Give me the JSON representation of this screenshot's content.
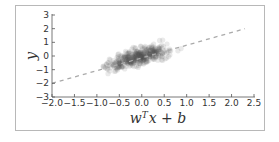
{
  "chart_data": {
    "type": "scatter",
    "title": "",
    "xlabel": "w^T x + b",
    "ylabel": "y",
    "xlim": [
      -2.0,
      2.5
    ],
    "ylim": [
      -3,
      3
    ],
    "x_ticks": [
      "-2.0",
      "-1.5",
      "-1.0",
      "-0.5",
      "0.0",
      "0.5",
      "1.0",
      "1.5",
      "2.0",
      "2.5"
    ],
    "y_ticks": [
      "3",
      "2",
      "1",
      "0",
      "-1",
      "-2",
      "-3"
    ],
    "grid": false,
    "legend": null,
    "series": [
      {
        "name": "samples",
        "kind": "scatter",
        "color": "#555555",
        "alpha": 0.12,
        "description": "dense cloud of semi-transparent points, x mostly in [-1.3, 1.1], y approx 0.9x with noise sd ~0.5"
      },
      {
        "name": "fit",
        "kind": "line",
        "style": "dashed",
        "color": "#aaaaaa",
        "x": [
          -2.0,
          2.3
        ],
        "y": [
          -2.0,
          2.0
        ]
      }
    ]
  },
  "labels": {
    "xlabel_base": "w",
    "xlabel_sup": "T",
    "xlabel_rest": "x + b",
    "ylabel": "y"
  }
}
